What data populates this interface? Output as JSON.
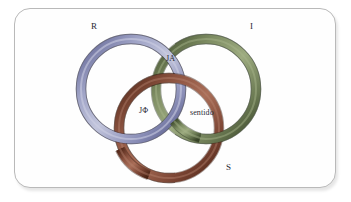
{
  "figure": {
    "kind": "borromean-rings-diagram",
    "background_color": "#ffffff",
    "card_background": "#fefefe",
    "card_border_color": "#b9b9b9"
  },
  "rings": [
    {
      "id": "real",
      "label": "R",
      "color": "#8b8fb8",
      "color_dark": "#5d6090",
      "color_light": "#b9bcd6",
      "position": "upper-left"
    },
    {
      "id": "imaginary",
      "label": "I",
      "color": "#6b7a53",
      "color_dark": "#44512f",
      "color_light": "#93a077",
      "position": "upper-right"
    },
    {
      "id": "symbolic",
      "label": "S",
      "color": "#7a4433",
      "color_dark": "#552a1d",
      "color_light": "#a06854",
      "position": "bottom-center"
    }
  ],
  "region_labels": [
    {
      "id": "ja",
      "text": "JA"
    },
    {
      "id": "jphi",
      "text": "JΦ"
    },
    {
      "id": "sentido",
      "text": "sentido"
    }
  ],
  "text_color": "#2a2a35"
}
